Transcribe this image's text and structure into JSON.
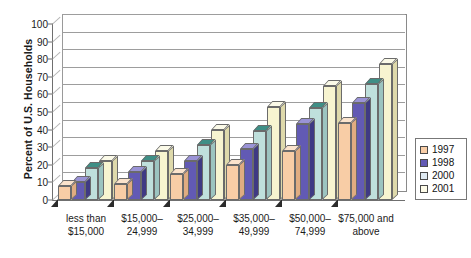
{
  "chart_data": {
    "type": "bar",
    "title": "",
    "subtitle": "",
    "xlabel": "",
    "ylabel": "Percent of U.S. Households",
    "ylim": [
      0,
      100
    ],
    "ytick_step": 10,
    "yticks": [
      "100",
      "90",
      "80",
      "70",
      "60",
      "50",
      "40",
      "30",
      "20",
      "10",
      "0"
    ],
    "grid": true,
    "legend_position": "right",
    "style": "3d-clustered-column",
    "categories": [
      "less than $15,000",
      "$15,000–24,999",
      "$25,000–34,999",
      "$35,000–49,999",
      "$50,000–74,999",
      "$75,000 and above"
    ],
    "category_lines": [
      [
        "less than",
        "$15,000"
      ],
      [
        "$15,000–",
        "24,999"
      ],
      [
        "$25,000–",
        "34,999"
      ],
      [
        "$35,000–",
        "49,999"
      ],
      [
        "$50,000–",
        "74,999"
      ],
      [
        "$75,000 and",
        "above"
      ]
    ],
    "series": [
      {
        "name": "1997",
        "color": "#f8cda6",
        "values": [
          8,
          9,
          15,
          20,
          28,
          44
        ]
      },
      {
        "name": "1998",
        "color": "#625ab4",
        "values": [
          10,
          16,
          22,
          29,
          43,
          55
        ]
      },
      {
        "name": "2000",
        "color": "#bfe0dc",
        "values": [
          18,
          22,
          31,
          39,
          52,
          66
        ]
      },
      {
        "name": "2001",
        "color": "#f7f4d0",
        "values": [
          22,
          28,
          40,
          53,
          65,
          77
        ]
      }
    ]
  },
  "legend": {
    "items": [
      {
        "label": "1997",
        "color": "#f8cda6"
      },
      {
        "label": "1998",
        "color": "#625ab4"
      },
      {
        "label": "2000",
        "color": "#dfeaf2"
      },
      {
        "label": "2001",
        "color": "#fdfbe8"
      }
    ]
  },
  "colors": {
    "series_1997_face": "#f8cda6",
    "series_1997_top": "#fbe3cc",
    "series_1997_side": "#e0ac81",
    "series_1998_face": "#625ab4",
    "series_1998_top": "#9a93d6",
    "series_1998_side": "#3f3a84",
    "series_2000_face": "#bfe0dc",
    "series_2000_top": "#3f8f86",
    "series_2000_side": "#9cc4c0",
    "series_2001_face": "#f7f4d0",
    "series_2001_top": "#fbfae8",
    "series_2001_side": "#ded9ab",
    "axis": "#6f6f6f",
    "grid": "#9d9d9d",
    "text": "#1a1a1a",
    "background": "#ffffff"
  }
}
